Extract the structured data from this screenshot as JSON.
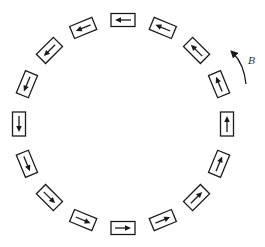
{
  "diagram": {
    "dipole_count": 16,
    "arrow_direction": "counterclockwise",
    "field_label": "B",
    "field_arrow_direction": "counterclockwise",
    "colors": {
      "stroke": "#1a1a1a",
      "background": "#ffffff"
    }
  }
}
